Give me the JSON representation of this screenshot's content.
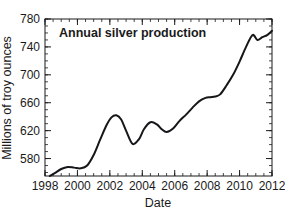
{
  "chart_data": {
    "type": "line",
    "title": "Annual silver production",
    "xlabel": "Date",
    "ylabel": "Millions of troy ounces",
    "xlim": [
      1998,
      2012
    ],
    "ylim": [
      555,
      780
    ],
    "grid": false,
    "legend": null,
    "x_ticks": [
      1998,
      2000,
      2002,
      2004,
      2006,
      2008,
      2010,
      2012
    ],
    "x_tick_labels": [
      "1998",
      "2000",
      "2002",
      "2004",
      "2006",
      "2008",
      "2010",
      "2012"
    ],
    "x_minor_step": 0.5,
    "y_ticks": [
      580,
      620,
      660,
      700,
      740,
      780
    ],
    "y_tick_labels": [
      "580",
      "620",
      "660",
      "700",
      "740",
      "780"
    ],
    "y_minor_step": 10,
    "line_color": "#17171a",
    "background_color": "#ffffff",
    "series": [
      {
        "name": "Annual silver production",
        "x": [
          1998.3,
          1998.6,
          1999.0,
          1999.4,
          1999.8,
          2000.2,
          2000.6,
          2001.0,
          2001.4,
          2001.8,
          2002.1,
          2002.4,
          2002.7,
          2003.0,
          2003.4,
          2003.8,
          2004.1,
          2004.5,
          2004.9,
          2005.2,
          2005.5,
          2005.9,
          2006.3,
          2006.7,
          2007.1,
          2007.5,
          2007.9,
          2008.2,
          2008.5,
          2008.8,
          2009.2,
          2009.6,
          2010.0,
          2010.4,
          2010.8,
          2011.1,
          2011.4,
          2011.7,
          2012.0
        ],
        "y": [
          555,
          559,
          565,
          568,
          567,
          566,
          570,
          585,
          607,
          628,
          639,
          642,
          636,
          620,
          601,
          608,
          622,
          632,
          629,
          622,
          618,
          623,
          634,
          643,
          653,
          662,
          667,
          668,
          669,
          672,
          685,
          700,
          719,
          740,
          757,
          750,
          754,
          757,
          763
        ]
      }
    ]
  },
  "axes": {
    "x_axis_name": "Date",
    "y_axis_name": "Millions of troy ounces"
  }
}
